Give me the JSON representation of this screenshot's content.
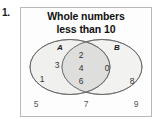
{
  "exercise": {
    "number_label": "1."
  },
  "diagram": {
    "title_line1": "Whole numbers",
    "title_line2": "less than 10",
    "type": "venn-two-set",
    "sets": [
      {
        "name": "A",
        "label": "A",
        "only_members": [
          "3",
          "1"
        ]
      },
      {
        "name": "B",
        "label": "B",
        "only_members": [
          "0",
          "8"
        ]
      }
    ],
    "intersection": {
      "label": "A and B",
      "members": [
        "2",
        "4",
        "6"
      ]
    },
    "outside_members": [
      "5",
      "7",
      "9"
    ],
    "colors": {
      "circle_fill": "#f0f0ee",
      "intersection_fill": "#dededc",
      "circle_stroke": "#636363",
      "box_stroke": "#b9b9b9",
      "text": "#333333",
      "title_text": "#111111"
    }
  }
}
